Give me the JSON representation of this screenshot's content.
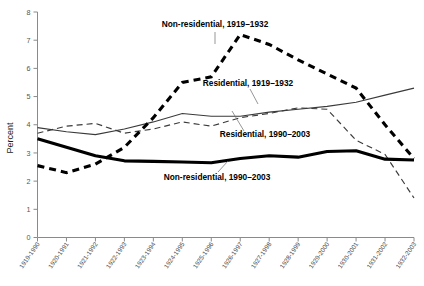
{
  "chart_data": {
    "type": "line",
    "title": "",
    "xlabel": "",
    "ylabel": "Percent",
    "ylim": [
      0,
      8
    ],
    "yticks": [
      0,
      1,
      2,
      3,
      4,
      5,
      6,
      7,
      8
    ],
    "grid": false,
    "legend_position": "inline-annotations",
    "categories": [
      "1919-1990",
      "1920-1991",
      "1921-1992",
      "1922-1993",
      "1923-1994",
      "1924-1995",
      "1925-1996",
      "1926-1997",
      "1927-1998",
      "1928-1999",
      "1929-2000",
      "1930-2001",
      "1931-2002",
      "1932-2003"
    ],
    "series": [
      {
        "name": "Non-residential, 1919–1932",
        "style": "thick-dashed",
        "color": "#000000",
        "values": [
          2.55,
          2.3,
          2.6,
          3.2,
          4.25,
          5.5,
          5.7,
          7.2,
          6.85,
          6.3,
          5.8,
          5.3,
          4.0,
          2.8
        ]
      },
      {
        "name": "Residential, 1919–1932",
        "style": "thin-dashed",
        "color": "#3a3a3a",
        "values": [
          3.7,
          3.95,
          4.05,
          3.7,
          3.85,
          4.1,
          3.95,
          4.25,
          4.4,
          4.6,
          4.55,
          3.45,
          2.95,
          1.4
        ]
      },
      {
        "name": "Residential, 1990–2003",
        "style": "thin-solid",
        "color": "#3a3a3a",
        "values": [
          3.9,
          3.75,
          3.65,
          3.85,
          4.1,
          4.4,
          4.3,
          4.3,
          4.45,
          4.55,
          4.65,
          4.8,
          5.05,
          5.3
        ]
      },
      {
        "name": "Non-residential, 1990–2003",
        "style": "thick-solid",
        "color": "#000000",
        "values": [
          3.5,
          3.2,
          2.9,
          2.72,
          2.7,
          2.68,
          2.65,
          2.8,
          2.9,
          2.85,
          3.05,
          3.08,
          2.78,
          2.75
        ]
      }
    ],
    "annotations": [
      {
        "text": "Non-residential, 1919–1932",
        "series": "Non-residential, 1919–1932"
      },
      {
        "text": "Residential, 1919–1932",
        "series": "Residential, 1919–1932"
      },
      {
        "text": "Residential, 1990–2003",
        "series": "Residential, 1990–2003"
      },
      {
        "text": "Non-residential, 1990–2003",
        "series": "Non-residential, 1990–2003"
      }
    ]
  }
}
